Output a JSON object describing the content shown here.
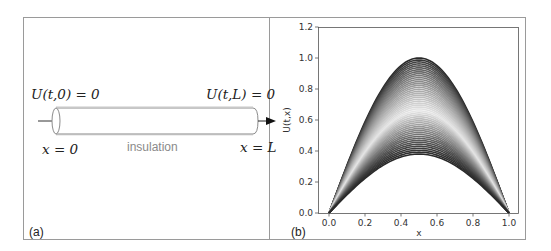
{
  "panel_a": {
    "label": "(a)",
    "boundary_left": "U(t,0) = 0",
    "boundary_right": "U(t,L) = 0",
    "position_left": "x = 0",
    "position_right": "x = L",
    "rod_caption": "insulation"
  },
  "panel_b": {
    "label": "(b)"
  },
  "chart_data": {
    "type": "line",
    "title": "",
    "xlabel": "x",
    "ylabel": "U(t,x)",
    "xlim": [
      0.0,
      1.0
    ],
    "ylim": [
      0.0,
      1.2
    ],
    "xticks": [
      "0.0",
      "0.2",
      "0.4",
      "0.6",
      "0.8",
      "1.0"
    ],
    "yticks": [
      "0.0",
      "0.2",
      "0.4",
      "0.6",
      "0.8",
      "1.0",
      "1.2"
    ],
    "grid": false,
    "legend": "none",
    "function": "A(t) * sin(pi * x)",
    "amplitude_range": [
      1.0,
      0.38
    ],
    "curve_count": 50,
    "colormap": "greyscale: dark at amplitude 1.0, light grey near 0.65, dark again near 0.38",
    "colors": {
      "dark": "#2a2a2a",
      "light": "#e6e6e6"
    }
  }
}
